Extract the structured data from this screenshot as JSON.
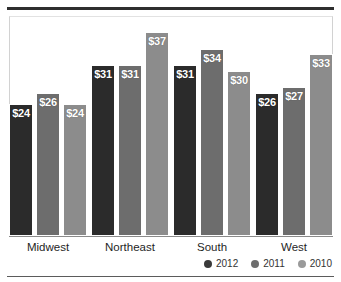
{
  "chart_data": {
    "type": "bar",
    "title": "",
    "subtitle": "",
    "xlabel": "",
    "ylabel": "",
    "ylim": [
      0,
      40
    ],
    "grid": false,
    "legend_position": "bottom-right",
    "value_prefix": "$",
    "categories": [
      "Midwest",
      "Northeast",
      "South",
      "West"
    ],
    "series": [
      {
        "name": "2012",
        "color": "#2b2b2b",
        "values": [
          24,
          31,
          31,
          26
        ],
        "labels": [
          "$24",
          "$31",
          "$31",
          "$26"
        ]
      },
      {
        "name": "2011",
        "color": "#6d6d6d",
        "values": [
          26,
          31,
          34,
          27
        ],
        "labels": [
          "$26",
          "$31",
          "$34",
          "$27"
        ]
      },
      {
        "name": "2010",
        "color": "#8c8c8c",
        "values": [
          24,
          37,
          30,
          33
        ],
        "labels": [
          "$24",
          "$37",
          "$30",
          "$33"
        ]
      }
    ]
  },
  "legend": {
    "items": [
      {
        "label": "2012",
        "color": "#3a3a3a"
      },
      {
        "label": "2011",
        "color": "#6d6d6d"
      },
      {
        "label": "2010",
        "color": "#9a9a9a"
      }
    ]
  },
  "axis": {
    "categories": [
      "Midwest",
      "Northeast",
      "South",
      "West"
    ]
  },
  "style": {
    "background": "#ffffff",
    "top_rule_color": "#2e2e2e",
    "bottom_rule_color": "#5b5b5b",
    "axis_color": "#8a8a8a",
    "label_color": "#1f1f1f",
    "value_label_color": "#ffffff"
  }
}
